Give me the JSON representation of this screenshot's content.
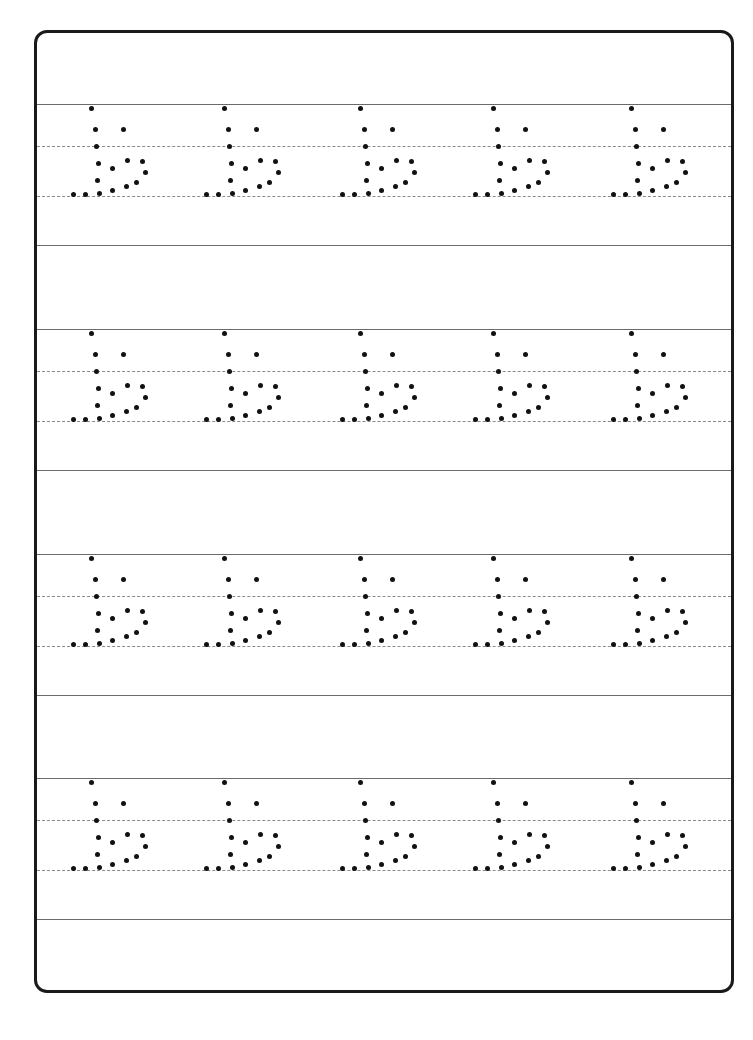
{
  "worksheet": {
    "title": "Letter tracing worksheet",
    "letter": "b (dotted tracing, stylized)",
    "rows": 4,
    "columns": 5,
    "colors": {
      "border": "#1a1a1a",
      "solid_line": "#6b6b6b",
      "dashed_line": "#8a8a8a",
      "dot": "#111111",
      "background": "#ffffff"
    }
  }
}
